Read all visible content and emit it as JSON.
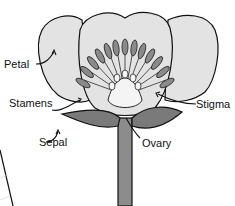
{
  "diagram": {
    "labels": {
      "petal": "Petal",
      "stamens": "Stamens",
      "sepal": "Sepal",
      "stigma": "Stigma",
      "ovary": "Ovary"
    },
    "colors": {
      "petal_fill": "#e3e3e3",
      "stamen_fill": "#8a8a8a",
      "sepal_fill": "#7a7a7a",
      "stem_fill": "#8c8c8c",
      "outline": "#111111",
      "background": "#ffffff"
    }
  }
}
